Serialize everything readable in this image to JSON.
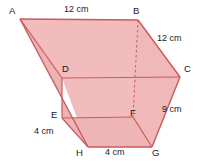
{
  "diagram": {
    "colors": {
      "fill": "#f2bcbd",
      "fill_dark": "#eeaaab",
      "stroke": "#c85a5f",
      "dashed_stroke": "#c85a5f",
      "label_color": "#1a1a1a",
      "background": "#ffffff"
    },
    "vertices": [
      {
        "name": "A",
        "label": "A",
        "x": 20,
        "y": 19,
        "label_x": 9,
        "label_y": 6
      },
      {
        "name": "B",
        "label": "B",
        "x": 138,
        "y": 20,
        "label_x": 133,
        "label_y": 6
      },
      {
        "name": "C",
        "label": "C",
        "x": 180,
        "y": 77,
        "label_x": 184,
        "label_y": 64
      },
      {
        "name": "D",
        "label": "D",
        "x": 62,
        "y": 78,
        "label_x": 62,
        "label_y": 64
      },
      {
        "name": "E",
        "label": "E",
        "x": 62,
        "y": 118,
        "label_x": 51,
        "label_y": 110
      },
      {
        "name": "F",
        "label": "F",
        "x": 133,
        "y": 117,
        "label_x": 130,
        "label_y": 108
      },
      {
        "name": "G",
        "label": "G",
        "x": 152,
        "y": 147,
        "label_x": 152,
        "label_y": 148
      },
      {
        "name": "H",
        "label": "H",
        "x": 88,
        "y": 147,
        "label_x": 76,
        "label_y": 148
      }
    ],
    "dimensions": [
      {
        "name": "top-edge",
        "text": "12 cm",
        "edge": "AB",
        "x": 64,
        "y": 5
      },
      {
        "name": "right-upper-edge",
        "text": "12 cm",
        "edge": "BC",
        "x": 157,
        "y": 34
      },
      {
        "name": "right-lower-edge",
        "text": "9 cm",
        "edge": "CG",
        "x": 162,
        "y": 105
      },
      {
        "name": "left-lower-edge",
        "text": "4 cm",
        "edge": "EH",
        "x": 34,
        "y": 127
      },
      {
        "name": "bottom-edge",
        "text": "4 cm",
        "edge": "HG",
        "x": 105,
        "y": 148
      }
    ],
    "edges": {
      "solid": [
        "A-B",
        "B-C",
        "C-D",
        "D-A",
        "A-H",
        "D-E",
        "E-F",
        "E-H",
        "H-G",
        "G-F",
        "G-C",
        "F-B-dashed"
      ],
      "dashed": [
        "B-F"
      ]
    }
  }
}
